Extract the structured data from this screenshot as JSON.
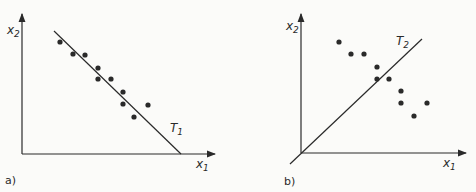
{
  "figure": {
    "panels": [
      {
        "id": "a",
        "panel_label": "a)",
        "x_axis_label": "x",
        "x_axis_sub": "1",
        "y_axis_label": "x",
        "y_axis_sub": "2",
        "line_label": "T",
        "line_sub": "1",
        "line": {
          "x1": 54,
          "y1": 31,
          "x2": 181,
          "y2": 154
        },
        "points": [
          [
            60,
            42
          ],
          [
            73,
            54
          ],
          [
            85,
            55
          ],
          [
            98,
            68
          ],
          [
            98,
            79
          ],
          [
            111,
            79
          ],
          [
            123,
            92
          ],
          [
            123,
            104
          ],
          [
            148,
            105
          ],
          [
            134,
            117
          ]
        ]
      },
      {
        "id": "b",
        "panel_label": "b)",
        "x_axis_label": "x",
        "x_axis_sub": "1",
        "y_axis_label": "x",
        "y_axis_sub": "2",
        "line_label": "T",
        "line_sub": "2",
        "line": {
          "x1": 290,
          "y1": 164,
          "x2": 422,
          "y2": 39
        },
        "points": [
          [
            339,
            42
          ],
          [
            351,
            54
          ],
          [
            364,
            54
          ],
          [
            377,
            67
          ],
          [
            377,
            79
          ],
          [
            389,
            79
          ],
          [
            401,
            91
          ],
          [
            401,
            103
          ],
          [
            427,
            103
          ],
          [
            414,
            116
          ]
        ]
      }
    ],
    "colors": {
      "ink": "#2a2a2a",
      "paper": "#fbfbf9"
    }
  }
}
